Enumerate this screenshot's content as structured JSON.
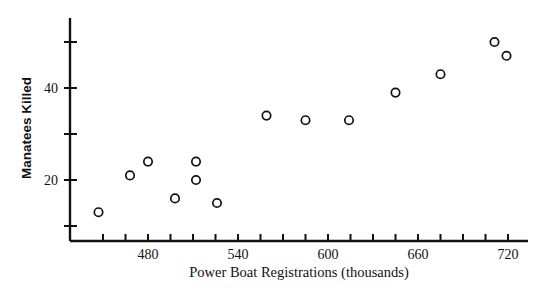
{
  "chart_data": {
    "type": "scatter",
    "title": "",
    "xlabel": "Power Boat Registrations (thousands)",
    "ylabel": "Manatees Killed",
    "xlim": [
      447,
      723
    ],
    "ylim": [
      7,
      54
    ],
    "grid": false,
    "legend": "none",
    "x_tick_labels": [
      "480",
      "540",
      "600",
      "660",
      "720"
    ],
    "x_tick_values": [
      480,
      540,
      600,
      660,
      720
    ],
    "x_minor_tick_values": [
      450,
      465,
      495,
      510,
      525,
      555,
      570,
      585,
      615,
      630,
      645,
      675,
      690,
      705
    ],
    "y_tick_labels": [
      "20",
      "40"
    ],
    "y_tick_values": [
      20,
      40
    ],
    "y_minor_tick_values": [
      10,
      30,
      50
    ],
    "points": [
      {
        "x": 447,
        "y": 13
      },
      {
        "x": 468,
        "y": 21
      },
      {
        "x": 480,
        "y": 24
      },
      {
        "x": 498,
        "y": 16
      },
      {
        "x": 512,
        "y": 24
      },
      {
        "x": 512,
        "y": 20
      },
      {
        "x": 526,
        "y": 15
      },
      {
        "x": 559,
        "y": 34
      },
      {
        "x": 585,
        "y": 33
      },
      {
        "x": 614,
        "y": 33
      },
      {
        "x": 645,
        "y": 39
      },
      {
        "x": 675,
        "y": 43
      },
      {
        "x": 711,
        "y": 50
      },
      {
        "x": 719,
        "y": 47
      }
    ],
    "series": [
      {
        "name": "Manatees killed vs power boat registrations",
        "x": [
          447,
          468,
          480,
          498,
          512,
          512,
          526,
          559,
          585,
          614,
          645,
          675,
          711,
          719
        ],
        "values": [
          13,
          21,
          24,
          16,
          24,
          20,
          15,
          34,
          33,
          33,
          39,
          43,
          50,
          47
        ]
      }
    ],
    "marker": {
      "shape": "open-circle",
      "color": "#111111",
      "size": 4.2
    }
  }
}
